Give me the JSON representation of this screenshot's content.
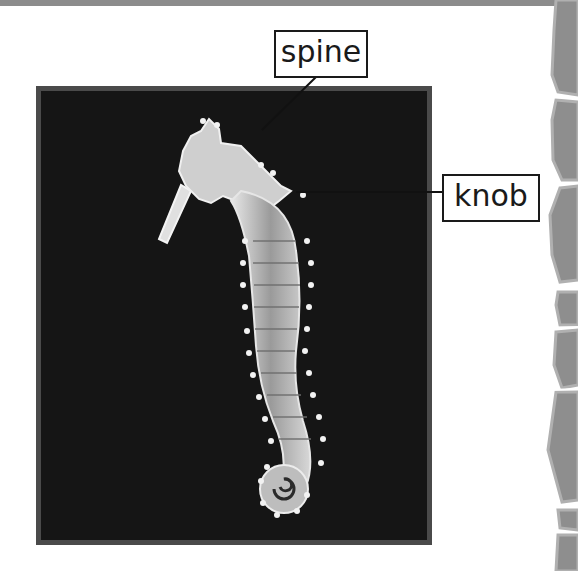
{
  "page": {
    "top_bar_color": "#8c8c8c",
    "background": "#ffffff"
  },
  "figure": {
    "background_color": "#151515",
    "frame_color": "#4a4a4a",
    "labels": [
      {
        "id": "spine",
        "text": "spine",
        "points_to": "spine on seahorse neck"
      },
      {
        "id": "knob",
        "text": "knob",
        "points_to": "knob on seahorse back"
      }
    ]
  },
  "decoration": {
    "side_column": "gray stone column",
    "stone_color": "#8e8e8e",
    "stone_highlight": "#b0b0b0"
  }
}
